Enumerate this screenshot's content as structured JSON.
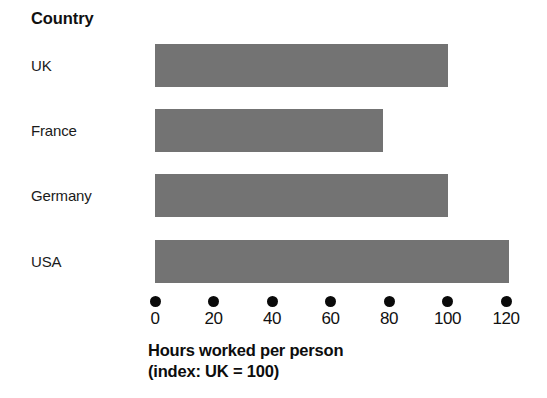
{
  "chart_data": {
    "type": "bar",
    "orientation": "horizontal",
    "title": "",
    "xlabel": "Hours worked per person (index: UK = 100)",
    "ylabel": "Country",
    "categories": [
      "UK",
      "France",
      "Germany",
      "USA"
    ],
    "values": [
      100,
      78,
      100,
      121
    ],
    "series": [
      {
        "name": "Hours worked per person (index: UK = 100)",
        "values": [
          100,
          78,
          100,
          121
        ]
      }
    ],
    "xlim": [
      0,
      120
    ],
    "xticks": [
      0,
      20,
      40,
      60,
      80,
      100,
      120
    ],
    "xtick_labels": [
      "0",
      "20",
      "40",
      "60",
      "80",
      "100",
      "120"
    ],
    "tick_marker": "filled-circle",
    "grid": false,
    "legend": false,
    "bar_color": "#737373",
    "background_color": "#ffffff",
    "text_color": "#111111"
  },
  "axis": {
    "title_line1": "Hours worked per person",
    "title_line2": "(index: UK = 100)"
  },
  "category_axis": {
    "header": "Country",
    "labels": [
      "UK",
      "France",
      "Germany",
      "USA"
    ]
  },
  "bars": [
    {
      "label": "UK",
      "value": 100
    },
    {
      "label": "France",
      "value": 78
    },
    {
      "label": "Germany",
      "value": 100
    },
    {
      "label": "USA",
      "value": 121
    }
  ],
  "ticks": [
    {
      "value": 0,
      "label": "0"
    },
    {
      "value": 20,
      "label": "20"
    },
    {
      "value": 40,
      "label": "40"
    },
    {
      "value": 60,
      "label": "60"
    },
    {
      "value": 80,
      "label": "80"
    },
    {
      "value": 100,
      "label": "100"
    },
    {
      "value": 120,
      "label": "120"
    }
  ]
}
